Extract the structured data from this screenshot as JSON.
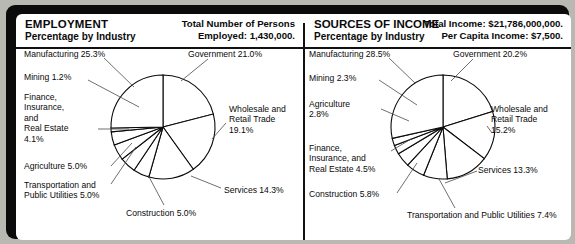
{
  "panels": [
    {
      "title": "EMPLOYMENT",
      "subtitle": "Percentage by Industry",
      "stat1": "Total Number of Persons",
      "stat2": "Employed: 1,430,000.",
      "chart_data": {
        "type": "pie",
        "title": "EMPLOYMENT — Percentage by Industry",
        "unit": "percent",
        "legend": "labels-with-leader-lines",
        "start_angle_deg": -90,
        "direction": "clockwise",
        "categories": [
          "Government",
          "Wholesale and Retail Trade",
          "Services",
          "Construction",
          "Transportation and Public Utilities",
          "Agriculture",
          "Finance, Insurance, and Real Estate",
          "Mining",
          "Manufacturing"
        ],
        "values": [
          21.0,
          19.1,
          14.3,
          5.0,
          5.0,
          5.0,
          4.1,
          1.2,
          25.3
        ],
        "labels": [
          "Government 21.0%",
          "Wholesale and\nRetail Trade\n19.1%",
          "Services 14.3%",
          "Construction 5.0%",
          "Transportation and\nPublic Utilities 5.0%",
          "Agriculture 5.0%",
          "Finance,\nInsurance,\nand\nReal Estate\n4.1%",
          "Mining 1.2%",
          "Manufacturing 25.3%"
        ]
      }
    },
    {
      "title": "SOURCES OF INCOME",
      "subtitle": "Percentage by Industry",
      "stat1": "Total Income: $21,786,000,000.",
      "stat2": "Per Capita Income: $7,500.",
      "chart_data": {
        "type": "pie",
        "title": "SOURCES OF INCOME — Percentage by Industry",
        "unit": "percent",
        "legend": "labels-with-leader-lines",
        "start_angle_deg": -90,
        "direction": "clockwise",
        "categories": [
          "Government",
          "Wholesale and Retail Trade",
          "Services",
          "Transportation and Public Utilities",
          "Construction",
          "Finance, Insurance, and Real Estate",
          "Agriculture",
          "Mining",
          "Manufacturing"
        ],
        "values": [
          20.2,
          15.2,
          13.3,
          7.4,
          5.8,
          4.5,
          2.8,
          2.3,
          28.5
        ],
        "labels": [
          "Government 20.2%",
          "Wholesale and\nRetail Trade\n15.2%",
          "Services 13.3%",
          "Transportation and Public Utilities 7.4%",
          "Construction 5.8%",
          "Finance,\nInsurance, and\nReal Estate 4.5%",
          "Agriculture\n2.8%",
          "Mining 2.3%",
          "Manufacturing 28.5%"
        ]
      }
    }
  ],
  "left_labels": {
    "manufacturing": "Manufacturing 25.3%",
    "mining": "Mining 1.2%",
    "finance": "Finance,\nInsurance,\nand\nReal Estate\n4.1%",
    "agriculture": "Agriculture 5.0%",
    "transportation": "Transportation and\nPublic Utilities 5.0%",
    "construction": "Construction 5.0%",
    "services": "Services 14.3%",
    "wholesale": "Wholesale and\nRetail Trade\n19.1%",
    "government": "Government 21.0%"
  },
  "right_labels": {
    "manufacturing": "Manufacturing 28.5%",
    "mining": "Mining 2.3%",
    "agriculture": "Agriculture\n2.8%",
    "finance": "Finance,\nInsurance, and\nReal Estate 4.5%",
    "construction": "Construction 5.8%",
    "transportation": "Transportation and Public Utilities 7.4%",
    "services": "Services 13.3%",
    "wholesale": "Wholesale and\nRetail Trade\n15.2%",
    "government": "Government 20.2%"
  },
  "colors": {
    "frame": "#0b0b0b",
    "sheet": "#ffffff",
    "page": "#b9b9b4",
    "ink": "#0a0a0a"
  }
}
